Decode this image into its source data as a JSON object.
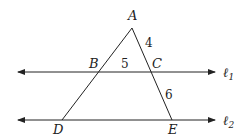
{
  "diagram": {
    "type": "geometry",
    "points": {
      "A": {
        "label": "A",
        "x": 132,
        "y": 28
      },
      "B": {
        "label": "B",
        "x": 97,
        "y": 72
      },
      "C": {
        "label": "C",
        "x": 150,
        "y": 72
      },
      "D": {
        "label": "D",
        "x": 62,
        "y": 120
      },
      "E": {
        "label": "E",
        "x": 172,
        "y": 120
      }
    },
    "lines": {
      "l1": {
        "label": "ℓ",
        "subscript": "1",
        "y": 72,
        "x_start": 18,
        "x_end": 215
      },
      "l2": {
        "label": "ℓ",
        "subscript": "2",
        "y": 120,
        "x_start": 18,
        "x_end": 215
      }
    },
    "segment_lengths": {
      "AC": "4",
      "BC": "5",
      "CE": "6"
    },
    "colors": {
      "stroke": "#222222",
      "background": "#ffffff"
    }
  }
}
